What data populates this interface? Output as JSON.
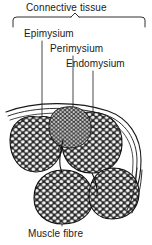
{
  "figure": {
    "background_color": "#ffffff",
    "ink_color": "#1a1a1a"
  },
  "bracket": {
    "name": "connective-tissue-bracket",
    "spans_labels": [
      "Epimysium",
      "Perimysium",
      "Endomysium"
    ]
  },
  "labels": {
    "connective_tissue": "Connective tissue",
    "epimysium": "Epimysium",
    "perimysium": "Perimysium",
    "endomysium": "Endomysium",
    "muscle_fibre": "Muscle fibre"
  },
  "leaders": {
    "epimysium_target": "outer sheath arcs at top-left of section",
    "perimysium_target": "boundary between adjacent fascicles",
    "endomysium_target": "interior of upper-right fascicle",
    "muscle_fibre_target": "individual fibre inside lower-left fascicle"
  }
}
